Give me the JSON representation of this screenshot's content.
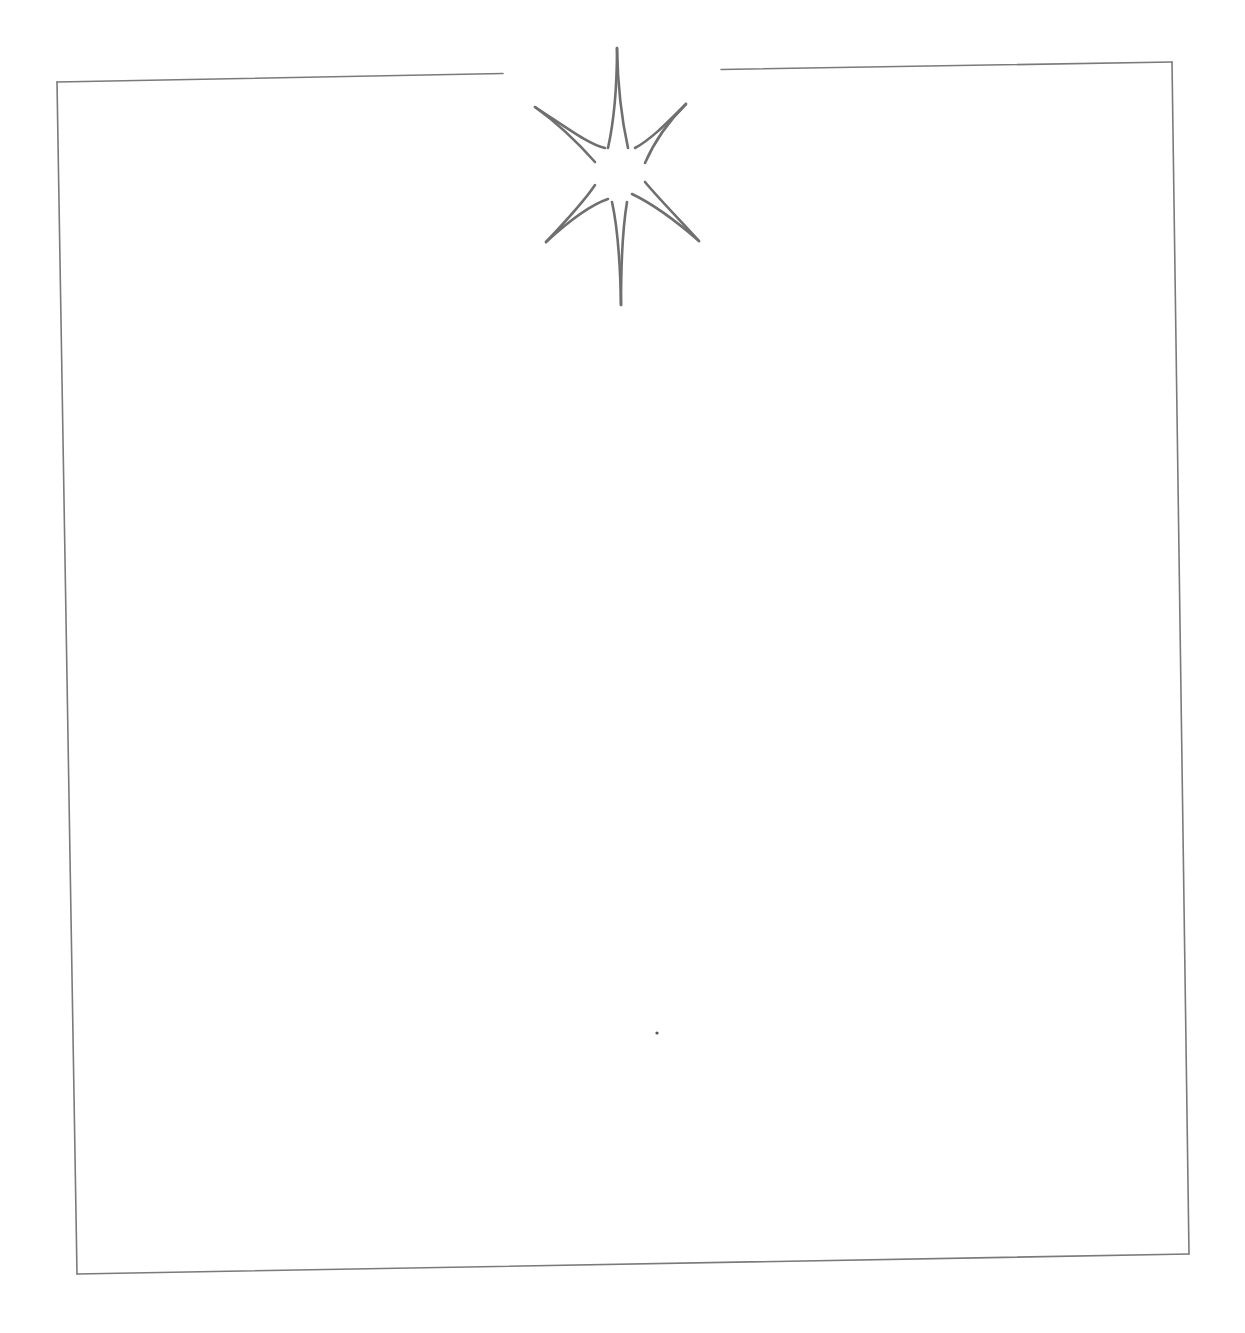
{
  "page": {
    "background": "#ffffff",
    "line_color": "#7a7a7a",
    "star_color": "#6f6f6f"
  },
  "frame": {
    "corners": {
      "top_left": [
        57,
        82
      ],
      "top_right": [
        1172,
        62
      ],
      "bottom_left": [
        77,
        1274
      ],
      "bottom_right": [
        1189,
        1254
      ]
    },
    "top_gap": [
      503,
      721
    ]
  },
  "ornament": {
    "icon": "sparkle-star-icon",
    "center": [
      620,
      175
    ],
    "arm_count": 8
  }
}
